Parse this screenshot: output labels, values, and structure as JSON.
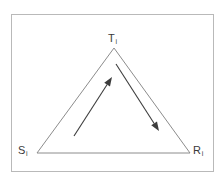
{
  "figure": {
    "name": "triangle-transition-diagram",
    "background_color": "#ffffff",
    "frame": {
      "border_color": "#b9b9b9",
      "x": 11,
      "y": 14,
      "width": 203,
      "height": 158
    },
    "stroke_color": "#8c8c8c",
    "arrow_color": "#3d3d3d",
    "label_color": "#3a3a3a"
  },
  "vertices": [
    {
      "id": "T",
      "letter": "T",
      "subscript": "i",
      "role": "apex-top",
      "x": 114,
      "y": 48
    },
    {
      "id": "S",
      "letter": "S",
      "subscript": "i",
      "role": "bottom-left",
      "x": 37,
      "y": 153
    },
    {
      "id": "R",
      "letter": "R",
      "subscript": "i",
      "role": "bottom-right",
      "x": 190,
      "y": 153
    }
  ],
  "triangle": {
    "points": "114,48 37,153 190,153",
    "closed": true
  },
  "arrows": [
    {
      "id": "arrow-up-to-T",
      "from_label": "S",
      "to_label": "T",
      "x1": 74,
      "y1": 136,
      "x2": 112,
      "y2": 77,
      "direction": "up-right"
    },
    {
      "id": "arrow-down-to-R",
      "from_label": "T",
      "to_label": "R",
      "x1": 116,
      "y1": 64,
      "x2": 159,
      "y2": 131,
      "direction": "down-right"
    }
  ]
}
